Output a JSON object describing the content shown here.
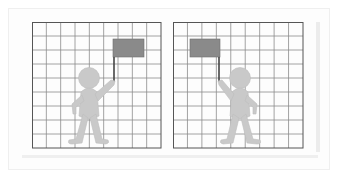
{
  "figure": {
    "grid": {
      "columns": 9,
      "rows": 9,
      "line_color": "#8c8c8c",
      "border_color": "#555555",
      "background": "#ffffff"
    },
    "colors": {
      "flag": "#8a8a8a",
      "pole": "#444444",
      "person": "#c9c9c9",
      "person_outline": "#bdbdbd"
    },
    "panels": [
      {
        "id": "left",
        "x": 32,
        "y": 22,
        "width": 129,
        "height": 126,
        "flag_side": "right",
        "person_faces": "flag on right, raised right hand"
      },
      {
        "id": "right",
        "x": 173,
        "y": 22,
        "width": 130,
        "height": 126,
        "flag_side": "left",
        "person_faces": "flag on left, raised left hand"
      }
    ]
  }
}
